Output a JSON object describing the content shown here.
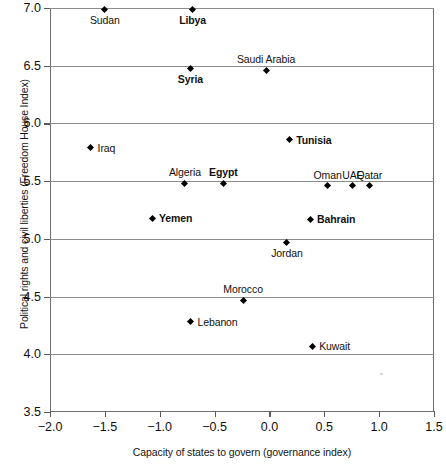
{
  "chart_data": {
    "type": "scatter",
    "title": "",
    "xlabel": "Capacity of states to govern (governance index)",
    "ylabel": "Political rights and civil liberties (Freedom House Index)",
    "xlim": [
      -2.0,
      1.5
    ],
    "ylim": [
      3.5,
      7.0
    ],
    "xticks": [
      "-2.0",
      "-1.5",
      "-1.0",
      "-0.5",
      "0.0",
      "0.5",
      "1.0",
      "1.5"
    ],
    "xtick_values": [
      -2.0,
      -1.5,
      -1.0,
      -0.5,
      0.0,
      0.5,
      1.0,
      1.5
    ],
    "yticks": [
      "3.5",
      "4.0",
      "4.5",
      "5.0",
      "5.5",
      "6.0",
      "6.5",
      "7.0"
    ],
    "ytick_values": [
      3.5,
      4.0,
      4.5,
      5.0,
      5.5,
      6.0,
      6.5,
      7.0
    ],
    "grid": "horizontal",
    "legend": "none",
    "marker": "diamond",
    "marker_color": "#000000",
    "points": [
      {
        "label": "Sudan",
        "x": -1.5,
        "y": 6.99,
        "bold": false,
        "label_pos": "below"
      },
      {
        "label": "Libya",
        "x": -0.7,
        "y": 6.99,
        "bold": true,
        "label_pos": "below"
      },
      {
        "label": "Syria",
        "x": -0.72,
        "y": 6.48,
        "bold": true,
        "label_pos": "below"
      },
      {
        "label": "Saudi Arabia",
        "x": -0.03,
        "y": 6.46,
        "bold": false,
        "label_pos": "above"
      },
      {
        "label": "Tunisia",
        "x": 0.18,
        "y": 5.86,
        "bold": true,
        "label_pos": "right"
      },
      {
        "label": "Iraq",
        "x": -1.63,
        "y": 5.79,
        "bold": false,
        "label_pos": "right"
      },
      {
        "label": "Algeria",
        "x": -0.77,
        "y": 5.48,
        "bold": false,
        "label_pos": "above"
      },
      {
        "label": "Egypt",
        "x": -0.42,
        "y": 5.48,
        "bold": true,
        "label_pos": "above"
      },
      {
        "label": "Oman",
        "x": 0.53,
        "y": 5.46,
        "bold": false,
        "label_pos": "above"
      },
      {
        "label": "UAE",
        "x": 0.76,
        "y": 5.46,
        "bold": false,
        "label_pos": "above"
      },
      {
        "label": "Qatar",
        "x": 0.91,
        "y": 5.46,
        "bold": false,
        "label_pos": "above"
      },
      {
        "label": "Yemen",
        "x": -1.07,
        "y": 5.18,
        "bold": true,
        "label_pos": "right"
      },
      {
        "label": "Bahrain",
        "x": 0.37,
        "y": 5.17,
        "bold": true,
        "label_pos": "right"
      },
      {
        "label": "Jordan",
        "x": 0.16,
        "y": 4.97,
        "bold": false,
        "label_pos": "below"
      },
      {
        "label": "Morocco",
        "x": -0.24,
        "y": 4.47,
        "bold": false,
        "label_pos": "above"
      },
      {
        "label": "Lebanon",
        "x": -0.72,
        "y": 4.28,
        "bold": false,
        "label_pos": "right"
      },
      {
        "label": "Kuwait",
        "x": 0.39,
        "y": 4.07,
        "bold": false,
        "label_pos": "right"
      }
    ]
  }
}
